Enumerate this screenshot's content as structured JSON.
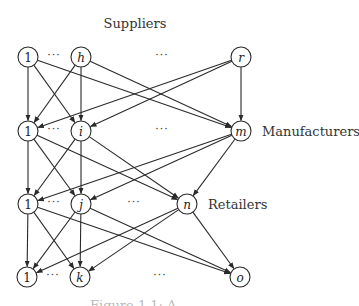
{
  "title": "Suppliers",
  "tiers": [
    {
      "name": "suppliers",
      "label": "",
      "y": 57,
      "nodes": [
        {
          "id": "s1",
          "label": "1",
          "x": 28,
          "italic": false
        },
        {
          "id": "sh",
          "label": "h",
          "x": 81,
          "italic": true
        },
        {
          "id": "sr",
          "label": "r",
          "x": 241,
          "italic": true
        }
      ],
      "ellipses": [
        {
          "x": 54,
          "text": "···"
        },
        {
          "x": 162,
          "text": "···"
        }
      ]
    },
    {
      "name": "manufacturers",
      "label": "Manufacturers",
      "label_x": 262,
      "y": 131,
      "nodes": [
        {
          "id": "m1",
          "label": "1",
          "x": 28,
          "italic": false
        },
        {
          "id": "mi",
          "label": "i",
          "x": 81,
          "italic": true
        },
        {
          "id": "mm",
          "label": "m",
          "x": 241,
          "italic": true
        }
      ],
      "ellipses": [
        {
          "x": 54,
          "text": "···"
        },
        {
          "x": 162,
          "text": "···"
        }
      ]
    },
    {
      "name": "retailers",
      "label": "Retailers",
      "label_x": 208,
      "y": 204,
      "nodes": [
        {
          "id": "r1",
          "label": "1",
          "x": 28,
          "italic": false
        },
        {
          "id": "rj",
          "label": "j",
          "x": 81,
          "italic": true
        },
        {
          "id": "rn",
          "label": "n",
          "x": 187,
          "italic": true
        }
      ],
      "ellipses": [
        {
          "x": 54,
          "text": "···"
        },
        {
          "x": 134,
          "text": "···"
        }
      ]
    },
    {
      "name": "customers",
      "label": "",
      "y": 277,
      "nodes": [
        {
          "id": "c1",
          "label": "1",
          "x": 27,
          "italic": false
        },
        {
          "id": "ck",
          "label": "k",
          "x": 80,
          "italic": true
        },
        {
          "id": "co",
          "label": "o",
          "x": 240,
          "italic": true
        }
      ],
      "ellipses": [
        {
          "x": 53,
          "text": "···"
        },
        {
          "x": 160,
          "text": "···"
        }
      ]
    }
  ],
  "edges": [
    [
      "s1",
      "m1"
    ],
    [
      "s1",
      "mi"
    ],
    [
      "s1",
      "mm"
    ],
    [
      "sh",
      "m1"
    ],
    [
      "sh",
      "mi"
    ],
    [
      "sh",
      "mm"
    ],
    [
      "sr",
      "m1"
    ],
    [
      "sr",
      "mi"
    ],
    [
      "sr",
      "mm"
    ],
    [
      "m1",
      "r1"
    ],
    [
      "m1",
      "rj"
    ],
    [
      "m1",
      "rn"
    ],
    [
      "mi",
      "r1"
    ],
    [
      "mi",
      "rj"
    ],
    [
      "mi",
      "rn"
    ],
    [
      "mm",
      "r1"
    ],
    [
      "mm",
      "rj"
    ],
    [
      "mm",
      "rn"
    ],
    [
      "r1",
      "c1"
    ],
    [
      "r1",
      "ck"
    ],
    [
      "r1",
      "co"
    ],
    [
      "rj",
      "c1"
    ],
    [
      "rj",
      "ck"
    ],
    [
      "rj",
      "co"
    ],
    [
      "rn",
      "c1"
    ],
    [
      "rn",
      "ck"
    ],
    [
      "rn",
      "co"
    ]
  ],
  "caption_cut": "Figure 1.1: A ..."
}
